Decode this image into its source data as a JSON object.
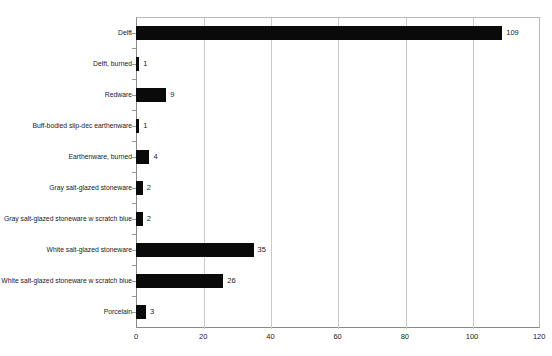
{
  "chart_data": {
    "type": "bar",
    "orientation": "horizontal",
    "title": "",
    "xlabel": "",
    "ylabel": "",
    "xlim": [
      0,
      120
    ],
    "xticks": [
      0,
      20,
      40,
      60,
      80,
      100,
      120
    ],
    "grid": true,
    "legend": false,
    "categories": [
      "Delft",
      "Delft, burned",
      "Redware",
      "Buff-bodied slip-dec earthenware",
      "Earthenware, burned",
      "Gray salt-glazed stoneware",
      "Gray salt-glazed stoneware w scratch blue",
      "White salt-glazed stoneware",
      "White salt-glazed stoneware w scratch blue",
      "Porcelain"
    ],
    "values": [
      109,
      1,
      9,
      1,
      4,
      2,
      2,
      35,
      26,
      3
    ],
    "data_labels": [
      "109",
      "1",
      "9",
      "1",
      "4",
      "2",
      "2",
      "35",
      "26",
      "3"
    ],
    "bar_color": "#0a0a0a"
  },
  "axis": {
    "tick_labels": [
      "0",
      "20",
      "40",
      "60",
      "80",
      "100",
      "120"
    ]
  },
  "header": {
    "cropped_title": ""
  }
}
